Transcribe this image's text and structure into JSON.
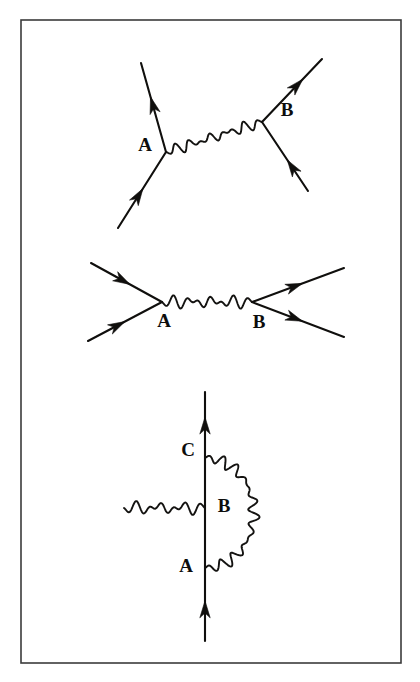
{
  "figure": {
    "background_color": "#ffffff",
    "border_color": "#3b3b3b",
    "ink_color": "#100f0d",
    "border": {
      "x": 21,
      "y": 20,
      "width": 380,
      "height": 643
    }
  },
  "diagrams": [
    {
      "id": "diagram-1",
      "name": "t-channel-exchange",
      "caption": "",
      "vertices": [
        {
          "label": "A",
          "x": 166,
          "y": 152,
          "label_x": 145,
          "label_y": 147
        },
        {
          "label": "B",
          "x": 262,
          "y": 122,
          "label_x": 287,
          "label_y": 112
        }
      ],
      "fermion_legs": [
        {
          "name": "incoming-lower-left",
          "from": [
            118,
            228
          ],
          "to": [
            166,
            152
          ],
          "arrow_dir": "up-right",
          "arrow_t": 0.52
        },
        {
          "name": "outgoing-upper-left",
          "from": [
            166,
            152
          ],
          "to": [
            141,
            63
          ],
          "arrow_dir": "up-left",
          "arrow_t": 0.62
        },
        {
          "name": "incoming-lower-right",
          "from": [
            308,
            191
          ],
          "to": [
            262,
            122
          ],
          "arrow_dir": "up-left",
          "arrow_t": 0.45
        },
        {
          "name": "outgoing-upper-right",
          "from": [
            262,
            122
          ],
          "to": [
            322,
            59
          ],
          "arrow_dir": "up-right",
          "arrow_t": 0.68
        }
      ],
      "photon": {
        "name": "exchange-photon",
        "from": [
          166,
          152
        ],
        "to": [
          262,
          122
        ],
        "cycles": 7,
        "amplitude": 6
      }
    },
    {
      "id": "diagram-2",
      "name": "annihilation-channel",
      "caption": "",
      "vertices": [
        {
          "label": "A",
          "x": 162,
          "y": 302,
          "label_x": 164,
          "label_y": 323
        },
        {
          "label": "B",
          "x": 252,
          "y": 302,
          "label_x": 259,
          "label_y": 324
        }
      ],
      "fermion_legs": [
        {
          "name": "incoming-upper-left",
          "from": [
            91,
            263
          ],
          "to": [
            162,
            302
          ],
          "arrow_dir": "down-right",
          "arrow_t": 0.55
        },
        {
          "name": "incoming-lower-left",
          "from": [
            88,
            341
          ],
          "to": [
            162,
            302
          ],
          "arrow_dir": "up-right",
          "arrow_t": 0.5
        },
        {
          "name": "outgoing-upper-right",
          "from": [
            252,
            302
          ],
          "to": [
            344,
            268
          ],
          "arrow_dir": "up-right",
          "arrow_t": 0.55
        },
        {
          "name": "outgoing-lower-right",
          "from": [
            252,
            302
          ],
          "to": [
            344,
            337
          ],
          "arrow_dir": "down-right",
          "arrow_t": 0.55
        }
      ],
      "photon": {
        "name": "exchange-photon",
        "from": [
          162,
          302
        ],
        "to": [
          252,
          302
        ],
        "cycles": 6,
        "amplitude": 7
      }
    },
    {
      "id": "diagram-3",
      "name": "vertex-correction-loop",
      "caption": "",
      "vertices": [
        {
          "label": "C",
          "x": 205,
          "y": 458,
          "label_x": 188,
          "label_y": 452
        },
        {
          "label": "B",
          "x": 205,
          "y": 508,
          "label_x": 224,
          "label_y": 508
        },
        {
          "label": "A",
          "x": 205,
          "y": 568,
          "label_x": 186,
          "label_y": 568
        }
      ],
      "fermion_legs": [
        {
          "name": "incoming-bottom",
          "from": [
            205,
            641
          ],
          "to": [
            205,
            568
          ],
          "arrow_dir": "up",
          "arrow_t": 0.55
        },
        {
          "name": "internal-A-to-B",
          "from": [
            205,
            568
          ],
          "to": [
            205,
            508
          ],
          "arrow_dir": "none",
          "arrow_t": 0
        },
        {
          "name": "internal-B-to-C",
          "from": [
            205,
            508
          ],
          "to": [
            205,
            458
          ],
          "arrow_dir": "none",
          "arrow_t": 0
        },
        {
          "name": "outgoing-top",
          "from": [
            205,
            458
          ],
          "to": [
            205,
            392
          ],
          "arrow_dir": "up",
          "arrow_t": 0.62
        }
      ],
      "photon_external": {
        "name": "incoming-photon",
        "from": [
          124,
          508
        ],
        "to": [
          205,
          508
        ],
        "cycles": 5,
        "amplitude": 7
      },
      "photon_loop": {
        "name": "loop-photon",
        "from": [
          205,
          458
        ],
        "to": [
          205,
          568
        ],
        "bulge_x": 254,
        "cycles": 11,
        "amplitude": 6
      }
    }
  ]
}
